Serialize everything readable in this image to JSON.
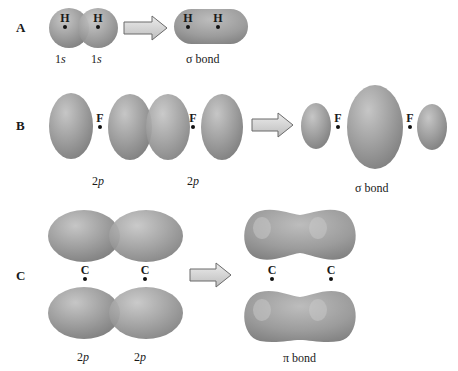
{
  "figure": {
    "colors": {
      "orbital_fill": "#9a9a9a",
      "orbital_highlight": "#c8c8c8",
      "orbital_shadow": "#7c7c7c",
      "arrow_fill": "#d8d8d8",
      "arrow_stroke": "#6a6a6a",
      "text": "#1a1a1a"
    },
    "panels": [
      {
        "label": "A",
        "atoms_before": [
          "H",
          "H"
        ],
        "orbital_labels_before": [
          "1",
          "s",
          "1",
          "s"
        ],
        "atoms_after": [
          "H",
          "H"
        ],
        "result_label": "σ bond"
      },
      {
        "label": "B",
        "atoms_before": [
          "F",
          "F"
        ],
        "orbital_labels_before": [
          "2",
          "p",
          "2",
          "p"
        ],
        "atoms_after": [
          "F",
          "F"
        ],
        "result_label": "σ bond"
      },
      {
        "label": "C",
        "atoms_before": [
          "C",
          "C"
        ],
        "orbital_labels_before": [
          "2",
          "p",
          "2",
          "p"
        ],
        "atoms_after": [
          "C",
          "C"
        ],
        "result_label": "π bond"
      }
    ]
  }
}
